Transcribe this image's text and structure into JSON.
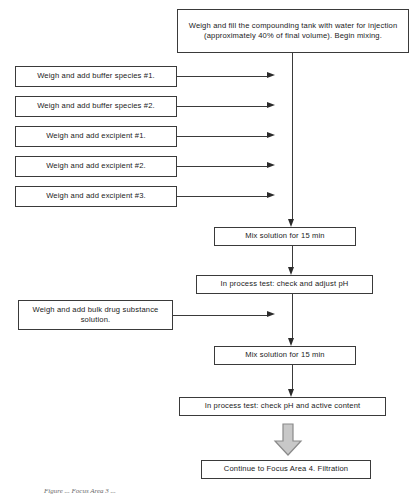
{
  "diagram": {
    "title_caption": "Figure ... Focus Area 3 ...",
    "colors": {
      "box_border": "#3a3a3a",
      "connector": "#3a3a3a",
      "arrow_fill": "#2b2b2b",
      "block_arrow_fill": "#c8c8c8",
      "block_arrow_border": "#8a8a8a",
      "background": "#ffffff",
      "text": "#1a1a1a"
    },
    "nodes": {
      "start_tank": "Weigh and fill the compounding tank with water for injection (approximately 40% of final volume). Begin mixing.",
      "buffer_1": "Weigh and add buffer species #1.",
      "buffer_2": "Weigh and add buffer species #2.",
      "excipient_1": "Weigh and add excipient #1.",
      "excipient_2": "Weigh and add excipient #2.",
      "excipient_3": "Weigh and add excipient #3.",
      "mix_1": "Mix solution for 15 min",
      "test_ph": "In process test: check and adjust pH",
      "bulk_drug": "Weigh and add bulk drug substance solution.",
      "mix_2": "Mix solution for 15 min",
      "test_ph_active": "In process test: check pH and active content",
      "continue_next": "Continue to Focus Area 4. Filtration"
    }
  }
}
